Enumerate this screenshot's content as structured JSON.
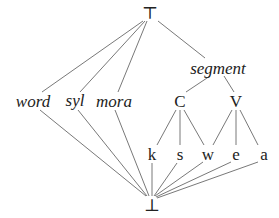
{
  "diagram": {
    "type": "lattice",
    "nodes": [
      {
        "id": "top",
        "label": "⊤",
        "x": 150,
        "y": 13,
        "italic": false
      },
      {
        "id": "word",
        "label": "word",
        "x": 33,
        "y": 101,
        "italic": true
      },
      {
        "id": "syl",
        "label": "syl",
        "x": 75,
        "y": 100,
        "italic": true
      },
      {
        "id": "mora",
        "label": "mora",
        "x": 114,
        "y": 101,
        "italic": true
      },
      {
        "id": "segment",
        "label": "segment",
        "x": 218,
        "y": 68,
        "italic": true
      },
      {
        "id": "C",
        "label": "C",
        "x": 180,
        "y": 101,
        "italic": false
      },
      {
        "id": "V",
        "label": "V",
        "x": 236,
        "y": 101,
        "italic": false
      },
      {
        "id": "k",
        "label": "k",
        "x": 152,
        "y": 154,
        "italic": false
      },
      {
        "id": "s",
        "label": "s",
        "x": 180,
        "y": 154,
        "italic": false
      },
      {
        "id": "w",
        "label": "w",
        "x": 208,
        "y": 154,
        "italic": false
      },
      {
        "id": "e",
        "label": "e",
        "x": 236,
        "y": 154,
        "italic": false
      },
      {
        "id": "a",
        "label": "a",
        "x": 264,
        "y": 154,
        "italic": false
      },
      {
        "id": "bottom",
        "label": "⊥",
        "x": 152,
        "y": 205,
        "italic": false
      }
    ],
    "edges": [
      [
        [
          143,
          21
        ],
        [
          42,
          92
        ]
      ],
      [
        [
          145,
          21
        ],
        [
          80,
          92
        ]
      ],
      [
        [
          147,
          21
        ],
        [
          118,
          92
        ]
      ],
      [
        [
          158,
          21
        ],
        [
          205,
          58
        ]
      ],
      [
        [
          210,
          76
        ],
        [
          186,
          92
        ]
      ],
      [
        [
          224,
          76
        ],
        [
          234,
          92
        ]
      ],
      [
        [
          176,
          110
        ],
        [
          157,
          145
        ]
      ],
      [
        [
          180,
          110
        ],
        [
          180,
          145
        ]
      ],
      [
        [
          184,
          110
        ],
        [
          204,
          145
        ]
      ],
      [
        [
          232,
          110
        ],
        [
          213,
          145
        ]
      ],
      [
        [
          236,
          110
        ],
        [
          236,
          145
        ]
      ],
      [
        [
          240,
          110
        ],
        [
          258,
          145
        ]
      ],
      [
        [
          40,
          110
        ],
        [
          146,
          196
        ]
      ],
      [
        [
          78,
          110
        ],
        [
          147,
          196
        ]
      ],
      [
        [
          115,
          110
        ],
        [
          149,
          196
        ]
      ],
      [
        [
          152,
          163
        ],
        [
          152,
          196
        ]
      ],
      [
        [
          177,
          163
        ],
        [
          154,
          196
        ]
      ],
      [
        [
          203,
          162
        ],
        [
          155,
          196
        ]
      ],
      [
        [
          231,
          162
        ],
        [
          156,
          197
        ]
      ],
      [
        [
          258,
          162
        ],
        [
          157,
          198
        ]
      ]
    ],
    "line_color": "#555555"
  }
}
